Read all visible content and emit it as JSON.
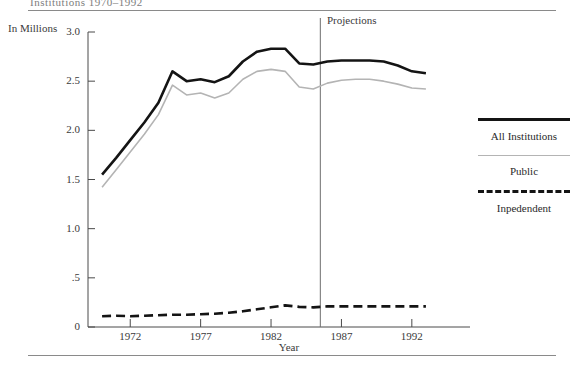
{
  "page": {
    "clipped_title_fragment": "Institutions 1970–1992",
    "x_axis_title": "Year",
    "y_axis_title": "In Millions",
    "projections_label": "Projections"
  },
  "legend": {
    "position": "right",
    "items": [
      {
        "label": "All Institutions",
        "style": "thick-solid",
        "color": "#141414"
      },
      {
        "label": "Public",
        "style": "thin-solid",
        "color": "#b4b4b4"
      },
      {
        "label": "Inpedendent",
        "style": "dashed",
        "color": "#141414"
      }
    ]
  },
  "chart_data": {
    "type": "line",
    "title": "",
    "xlabel": "Year",
    "ylabel": "In Millions",
    "xlim": [
      1969,
      1994
    ],
    "ylim": [
      0,
      3.0
    ],
    "ytick_labels": [
      "0",
      ".5",
      "1.0",
      "1.5",
      "2.0",
      "2.5",
      "3.0"
    ],
    "ytick_values": [
      0,
      0.5,
      1.0,
      1.5,
      2.0,
      2.5,
      3.0
    ],
    "xtick_labels": [
      "1972",
      "1977",
      "1982",
      "1987",
      "1992"
    ],
    "xtick_values": [
      1972,
      1977,
      1982,
      1987,
      1992
    ],
    "grid": false,
    "annotations": [
      {
        "text": "Projections",
        "type": "vline",
        "x": 1985.5
      }
    ],
    "x": [
      1970,
      1971,
      1972,
      1973,
      1974,
      1975,
      1976,
      1977,
      1978,
      1979,
      1980,
      1981,
      1982,
      1983,
      1984,
      1985,
      1986,
      1987,
      1988,
      1989,
      1990,
      1991,
      1992,
      1993
    ],
    "series": [
      {
        "name": "All Institutions",
        "color": "#141414",
        "style": "thick-solid",
        "values": [
          1.55,
          1.72,
          1.9,
          2.08,
          2.28,
          2.6,
          2.5,
          2.52,
          2.49,
          2.55,
          2.7,
          2.8,
          2.83,
          2.83,
          2.68,
          2.67,
          2.7,
          2.71,
          2.71,
          2.71,
          2.7,
          2.66,
          2.6,
          2.58
        ]
      },
      {
        "name": "Public",
        "color": "#b4b4b4",
        "style": "thin-solid",
        "values": [
          1.42,
          1.6,
          1.78,
          1.96,
          2.16,
          2.46,
          2.36,
          2.38,
          2.33,
          2.38,
          2.52,
          2.6,
          2.62,
          2.6,
          2.44,
          2.42,
          2.48,
          2.51,
          2.52,
          2.52,
          2.5,
          2.47,
          2.43,
          2.42
        ]
      },
      {
        "name": "Inpedendent",
        "color": "#141414",
        "style": "dashed",
        "values": [
          0.11,
          0.115,
          0.11,
          0.115,
          0.12,
          0.125,
          0.125,
          0.13,
          0.135,
          0.145,
          0.16,
          0.18,
          0.2,
          0.22,
          0.205,
          0.2,
          0.21,
          0.21,
          0.21,
          0.21,
          0.21,
          0.21,
          0.21,
          0.21
        ]
      }
    ]
  }
}
